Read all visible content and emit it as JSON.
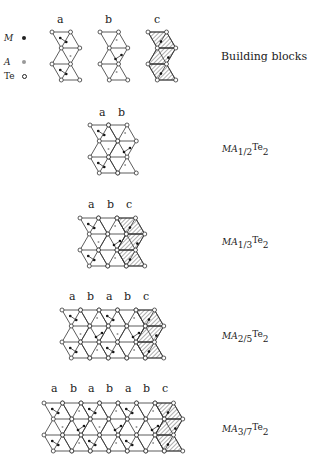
{
  "legend": {
    "items": [
      {
        "symbol": "M",
        "marker": "filled-dot"
      },
      {
        "symbol": "A",
        "marker": "gray-dot"
      },
      {
        "symbol": "Te",
        "marker": "open-circle"
      }
    ]
  },
  "building_blocks": {
    "labels": [
      "a",
      "b",
      "c"
    ],
    "caption": "Building blocks"
  },
  "structures": [
    {
      "sequence": [
        "a",
        "b"
      ],
      "formula": {
        "prefix": "MA",
        "sub": "1/2",
        "te": "Te",
        "te_sub": "2"
      }
    },
    {
      "sequence": [
        "a",
        "b",
        "c"
      ],
      "formula": {
        "prefix": "MA",
        "sub": "1/3",
        "te": "Te",
        "te_sub": "2"
      }
    },
    {
      "sequence": [
        "a",
        "b",
        "a",
        "b",
        "c"
      ],
      "formula": {
        "prefix": "MA",
        "sub": "2/5",
        "te": "Te",
        "te_sub": "2"
      }
    },
    {
      "sequence": [
        "a",
        "b",
        "a",
        "b",
        "a",
        "b",
        "c"
      ],
      "formula": {
        "prefix": "MA",
        "sub": "3/7",
        "te": "Te",
        "te_sub": "2"
      }
    }
  ]
}
